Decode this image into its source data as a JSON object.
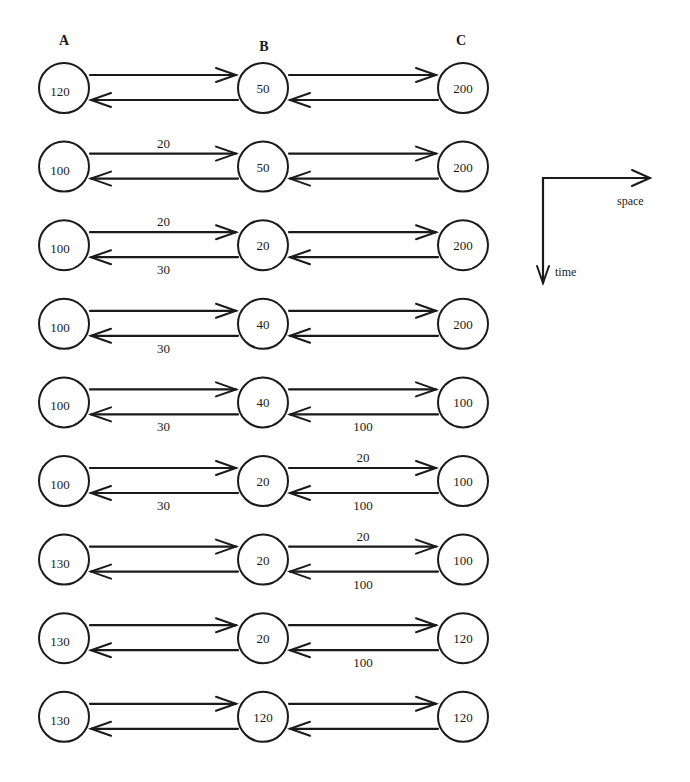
{
  "diagram": {
    "columns": [
      {
        "id": "A",
        "label": "A",
        "x": 64,
        "label_x": 64,
        "label_y": 45
      },
      {
        "id": "B",
        "label": "B",
        "x": 263,
        "label_x": 264,
        "label_y": 51
      },
      {
        "id": "C",
        "label": "C",
        "x": 463,
        "label_x": 461,
        "label_y": 45
      }
    ],
    "legend": {
      "space_label": "space",
      "time_label": "time"
    },
    "steps": [
      {
        "values": {
          "A": "120",
          "B": "50",
          "C": "200"
        },
        "edges": {
          "A_to_B": "",
          "B_to_A": "",
          "B_to_C": "",
          "C_to_B": ""
        }
      },
      {
        "values": {
          "A": "100",
          "B": "50",
          "C": "200"
        },
        "edges": {
          "A_to_B": "20",
          "B_to_A": "",
          "B_to_C": "",
          "C_to_B": ""
        }
      },
      {
        "values": {
          "A": "100",
          "B": "20",
          "C": "200"
        },
        "edges": {
          "A_to_B": "20",
          "B_to_A": "30",
          "B_to_C": "",
          "C_to_B": ""
        }
      },
      {
        "values": {
          "A": "100",
          "B": "40",
          "C": "200"
        },
        "edges": {
          "A_to_B": "",
          "B_to_A": "30",
          "B_to_C": "",
          "C_to_B": ""
        }
      },
      {
        "values": {
          "A": "100",
          "B": "40",
          "C": "100"
        },
        "edges": {
          "A_to_B": "",
          "B_to_A": "30",
          "B_to_C": "",
          "C_to_B": "100"
        }
      },
      {
        "values": {
          "A": "100",
          "B": "20",
          "C": "100"
        },
        "edges": {
          "A_to_B": "",
          "B_to_A": "30",
          "B_to_C": "20",
          "C_to_B": "100"
        }
      },
      {
        "values": {
          "A": "130",
          "B": "20",
          "C": "100"
        },
        "edges": {
          "A_to_B": "",
          "B_to_A": "",
          "B_to_C": "20",
          "C_to_B": "100"
        }
      },
      {
        "values": {
          "A": "130",
          "B": "20",
          "C": "120"
        },
        "edges": {
          "A_to_B": "",
          "B_to_A": "",
          "B_to_C": "",
          "C_to_B": "100"
        }
      },
      {
        "values": {
          "A": "130",
          "B": "120",
          "C": "120"
        },
        "edges": {
          "A_to_B": "",
          "B_to_A": "",
          "B_to_C": "",
          "C_to_B": ""
        }
      }
    ]
  }
}
